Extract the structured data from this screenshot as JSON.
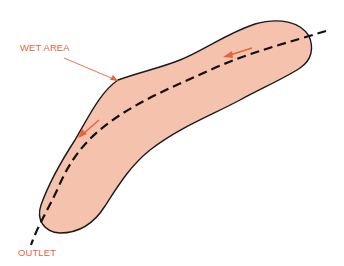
{
  "labels": {
    "wet_area": "WET AREA",
    "outlet": "OUTLET"
  },
  "colors": {
    "label": "#e8643c",
    "fill": "#f5c2ae",
    "outline": "#1a1a1a",
    "centerline": "#111111",
    "arrow": "#e8643c",
    "leader": "#e8643c",
    "background": "#ffffff"
  },
  "diagram": {
    "flow_arrows": 2,
    "flow_direction": "toward outlet (lower-left)"
  }
}
